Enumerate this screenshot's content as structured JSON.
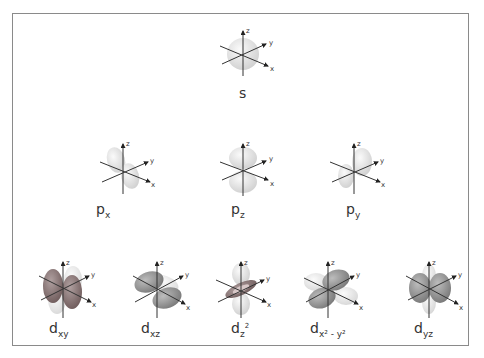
{
  "colors": {
    "border": "#8a8a8a",
    "lobe_light": "#e2e2e2",
    "lobe_dark": "#8a8a8a",
    "lobe_red": "#9a6a6a",
    "axis": "#333333"
  },
  "axis_labels": {
    "x": "x",
    "y": "y",
    "z": "z"
  },
  "orbitals": [
    {
      "id": "s",
      "main": "s",
      "sub": ""
    },
    {
      "id": "px",
      "main": "p",
      "sub": "x"
    },
    {
      "id": "pz",
      "main": "p",
      "sub": "z"
    },
    {
      "id": "py",
      "main": "p",
      "sub": "y"
    },
    {
      "id": "dxy",
      "main": "d",
      "sub": "xy"
    },
    {
      "id": "dxz",
      "main": "d",
      "sub": "xz"
    },
    {
      "id": "dz2",
      "main": "d",
      "sub": "z",
      "sup": "2"
    },
    {
      "id": "dx2y2",
      "main": "d",
      "sub": "x² - y²"
    },
    {
      "id": "dyz",
      "main": "d",
      "sub": "yz"
    }
  ]
}
